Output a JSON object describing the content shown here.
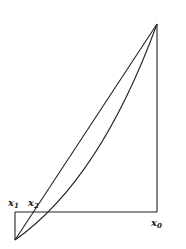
{
  "diagram": {
    "labels": {
      "x1": {
        "base": "x",
        "sub": "1"
      },
      "x2": {
        "base": "x",
        "sub": "2"
      },
      "x0": {
        "base": "x",
        "sub": "0"
      }
    },
    "stroke_color": "#222222",
    "background": "#ffffff"
  }
}
